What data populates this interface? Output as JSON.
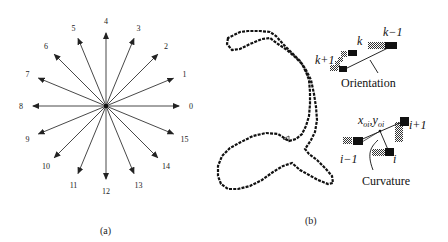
{
  "panel_a": {
    "caption": "(a)",
    "center": [
      106,
      106
    ],
    "radius": 73,
    "directions": [
      "0",
      "1",
      "2",
      "3",
      "4",
      "5",
      "6",
      "7",
      "8",
      "9",
      "10",
      "11",
      "12",
      "13",
      "14",
      "15"
    ]
  },
  "panel_b": {
    "caption": "(b)",
    "orientation": {
      "label": "Orientation",
      "points": [
        "k+1",
        "k",
        "k−1"
      ]
    },
    "curvature": {
      "label": "Curvature",
      "coord_label_x": "x",
      "coord_label_x_sub": "oi",
      "coord_sep": ",",
      "coord_label_y": "y",
      "coord_label_y_sub": "oi",
      "points": [
        "i−1",
        "i",
        "i+1"
      ]
    }
  },
  "colors": {
    "ink": "#111111",
    "checker": "#555555",
    "background": "#ffffff"
  }
}
